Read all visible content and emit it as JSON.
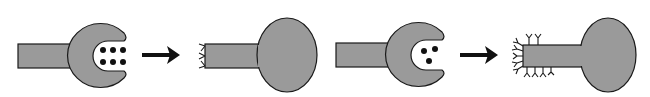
{
  "diagram": {
    "colors": {
      "shape_fill": "#9a9a9a",
      "stroke": "#1a1a1a",
      "dot": "#111111",
      "arrow": "#111111",
      "background": "#ffffff"
    },
    "panels": [
      {
        "id": "receptor-6-ligands",
        "type": "c-receptor",
        "ligand_dots": 6
      },
      {
        "id": "arrow-1",
        "type": "arrow"
      },
      {
        "id": "cell-few-receptors",
        "type": "bulb-cell",
        "surface_markers": 3
      },
      {
        "id": "receptor-3-ligands",
        "type": "c-receptor",
        "ligand_dots": 3
      },
      {
        "id": "arrow-2",
        "type": "arrow"
      },
      {
        "id": "cell-many-receptors",
        "type": "bulb-cell",
        "surface_markers": 13
      }
    ]
  }
}
